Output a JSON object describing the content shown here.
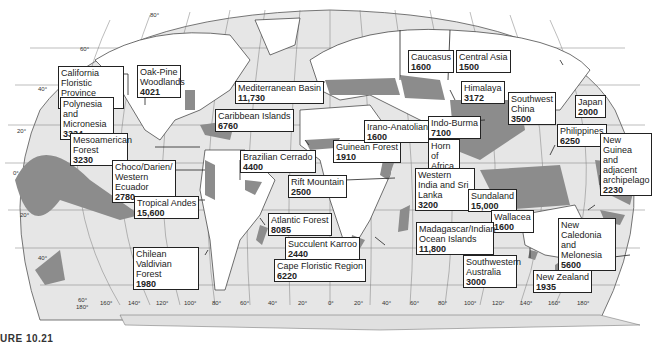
{
  "map": {
    "title": "Biodiversity hotspots of the world",
    "colors": {
      "ocean": "#e6e6e6",
      "land": "#ffffff",
      "hotspot": "#8c8c8c",
      "grid": "#7a7a7a",
      "border": "#333333"
    },
    "latitude_labels": [
      "80°",
      "60°",
      "40°",
      "20°",
      "0°",
      "20°",
      "40°",
      "60°"
    ],
    "longitude_labels": [
      "180°",
      "160°",
      "140°",
      "120°",
      "100°",
      "80°",
      "60°",
      "40°",
      "20°",
      "0°",
      "20°",
      "40°",
      "60°",
      "80°",
      "100°",
      "120°",
      "140°",
      "160°",
      "180°"
    ],
    "caption_fragment": "URE 10.21"
  },
  "hotspots": [
    {
      "name": "California Floristic Province",
      "count": "2141"
    },
    {
      "name": "Oak-Pine Woodlands",
      "count": "4021"
    },
    {
      "name": "Polynesia and Micronesia",
      "count": "3334"
    },
    {
      "name": "Mediterranean Basin",
      "count": "11,730"
    },
    {
      "name": "Caribbean Islands",
      "count": "6760"
    },
    {
      "name": "Mesoamerican Forest",
      "count": "3230"
    },
    {
      "name": "Choco/Darien/ Western Ecuador",
      "count": "2780"
    },
    {
      "name": "Tropical Andes",
      "count": "15,600"
    },
    {
      "name": "Chilean Valdivian Forest",
      "count": "1980"
    },
    {
      "name": "Brazilian Cerrado",
      "count": "4400"
    },
    {
      "name": "Atlantic Forest",
      "count": "8085"
    },
    {
      "name": "Succulent Karroo",
      "count": "2440"
    },
    {
      "name": "Cape Floristic Region",
      "count": "6220"
    },
    {
      "name": "Guinean Forest",
      "count": "1910"
    },
    {
      "name": "Rift Mountain",
      "count": "2500"
    },
    {
      "name": "Caucasus",
      "count": "1600"
    },
    {
      "name": "Central Asia",
      "count": "1500"
    },
    {
      "name": "Irano-Anatolian",
      "count": "1600"
    },
    {
      "name": "Himalaya",
      "count": "3172"
    },
    {
      "name": "Indo-Burma",
      "count": "7100"
    },
    {
      "name": "Southwest China",
      "count": "3500"
    },
    {
      "name": "Japan",
      "count": "2000"
    },
    {
      "name": "Horn of Africa",
      "count": "2770"
    },
    {
      "name": "Western India and Sri Lanka",
      "count": "3200"
    },
    {
      "name": "Philippines",
      "count": "6250"
    },
    {
      "name": "New Guinea and adjacent archipelago",
      "count": "2230"
    },
    {
      "name": "Sundaland",
      "count": "15,000"
    },
    {
      "name": "Wallacea",
      "count": "1600"
    },
    {
      "name": "Madagascar/Indian Ocean Islands",
      "count": "11,800"
    },
    {
      "name": "New Caledonia and Melonesia",
      "count": "5600"
    },
    {
      "name": "Southwestern Australia",
      "count": "3000"
    },
    {
      "name": "New Zealand",
      "count": "1935"
    }
  ]
}
